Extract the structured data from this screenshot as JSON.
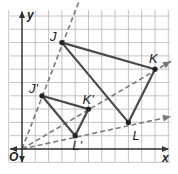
{
  "diagram": {
    "scale_factor": 0.5,
    "grid": {
      "cols": 12,
      "rows": 11,
      "origin_px": [
        22,
        149
      ],
      "cell_px": 13.3
    },
    "axes": {
      "x_label": "x",
      "y_label": "y",
      "origin_label": "O"
    },
    "original_triangle": {
      "vertices": [
        {
          "name": "J",
          "label": "J",
          "x": 3,
          "y": 8
        },
        {
          "name": "K",
          "label": "K",
          "x": 10,
          "y": 6
        },
        {
          "name": "L",
          "label": "L",
          "x": 8,
          "y": 2
        }
      ]
    },
    "image_triangle": {
      "vertices": [
        {
          "name": "J'",
          "label": "J'",
          "x": 1.5,
          "y": 4
        },
        {
          "name": "K'",
          "label": "K'",
          "x": 5,
          "y": 3
        },
        {
          "name": "L'",
          "label": "L'",
          "x": 4,
          "y": 1
        }
      ]
    },
    "rays": [
      {
        "through": "J"
      },
      {
        "through": "K"
      },
      {
        "through": "L"
      }
    ],
    "colors": {
      "grid": "#b5b5b5",
      "axis": "#333333",
      "triangle": "#4a4a4a",
      "ray": "#7a7a7a",
      "point": "#222222"
    }
  }
}
